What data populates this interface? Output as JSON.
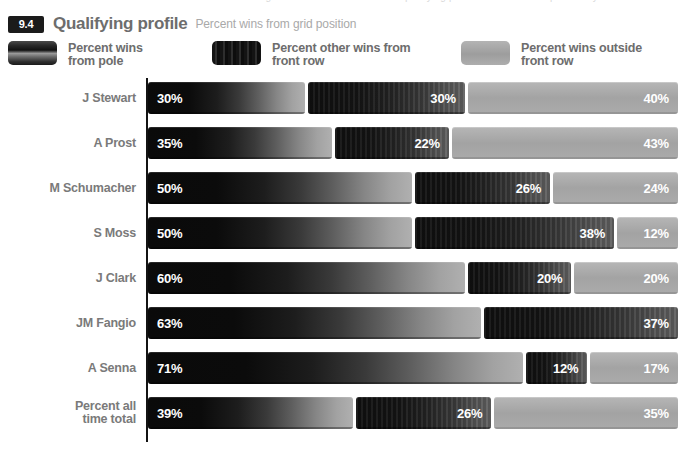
{
  "clipped_top_text": "significant correlation between qualifying position and race win probability is observed",
  "header": {
    "badge": "9.4",
    "title": "Qualifying profile",
    "subtitle": "Percent wins from grid position"
  },
  "legend": {
    "items": [
      {
        "label": "Percent wins\nfrom pole",
        "swatch": "pole-swatch",
        "color": "#111111"
      },
      {
        "label": "Percent other wins from\nfront row",
        "swatch": "front-row-swatch",
        "color": "#141414"
      },
      {
        "label": "Percent wins outside\nfront row",
        "swatch": "outside-front-row-swatch",
        "color": "#a3a3a3"
      }
    ]
  },
  "chart_data": {
    "type": "bar",
    "subtype": "stacked-horizontal-100",
    "title": "Qualifying profile",
    "subtitle": "Percent wins from grid position",
    "xlabel": "",
    "ylabel": "",
    "xlim": [
      0,
      100
    ],
    "grid": false,
    "legend_position": "top",
    "categories": [
      "J Stewart",
      "A Prost",
      "M Schumacher",
      "S Moss",
      "J Clark",
      "JM Fangio",
      "A Senna",
      "Percent all\ntime total"
    ],
    "series": [
      {
        "name": "Percent wins from pole",
        "values": [
          30,
          35,
          50,
          50,
          60,
          63,
          71,
          39
        ]
      },
      {
        "name": "Percent other wins from front row",
        "values": [
          30,
          22,
          26,
          38,
          20,
          37,
          12,
          26
        ]
      },
      {
        "name": "Percent wins outside front row",
        "values": [
          40,
          43,
          24,
          12,
          20,
          0,
          17,
          35
        ]
      }
    ],
    "value_labels": [
      [
        "30%",
        "30%",
        "40%"
      ],
      [
        "35%",
        "22%",
        "43%"
      ],
      [
        "50%",
        "26%",
        "24%"
      ],
      [
        "50%",
        "38%",
        "12%"
      ],
      [
        "60%",
        "20%",
        "20%"
      ],
      [
        "63%",
        "37%",
        ""
      ],
      [
        "71%",
        "12%",
        "17%"
      ],
      [
        "39%",
        "26%",
        "35%"
      ]
    ]
  }
}
